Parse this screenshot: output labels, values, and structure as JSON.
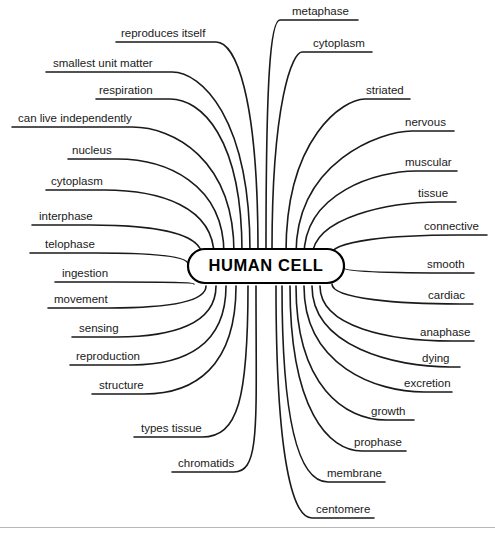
{
  "diagram": {
    "type": "mind-map",
    "title": "HUMAN CELL",
    "center": {
      "label": "HUMAN CELL",
      "x": 266,
      "y": 266,
      "width": 156,
      "height": 34,
      "radius": 17
    },
    "style": {
      "background": "#ffffff",
      "line_color": "#1a1a1a",
      "text_color": "#1a1a1a",
      "node_border": "#000000",
      "divider_color": "#b8b8b8"
    },
    "divider": {
      "y": 527
    },
    "branches": [
      {
        "id": "metaphase",
        "label": "metaphase",
        "side": "right",
        "label_x": 292,
        "label_y": 6,
        "line_x1": 272,
        "line_x2": 358,
        "line_y": 20,
        "anchor_x": 272,
        "anchor_y": 40,
        "curve_dx": 8,
        "hub_x": 266,
        "hub_y": 250
      },
      {
        "id": "cytoplasm-top",
        "label": "cytoplasm",
        "side": "right",
        "label_x": 313,
        "label_y": 38,
        "line_x1": 294,
        "line_x2": 372,
        "line_y": 52,
        "anchor_x": 294,
        "anchor_y": 72,
        "curve_dx": 8,
        "hub_x": 272,
        "hub_y": 250
      },
      {
        "id": "striated",
        "label": "striated",
        "side": "right",
        "label_x": 366,
        "label_y": 85,
        "line_x1": 347,
        "line_x2": 410,
        "line_y": 99,
        "anchor_x": 347,
        "anchor_y": 115,
        "curve_dx": 18,
        "hub_x": 286,
        "hub_y": 252
      },
      {
        "id": "nervous",
        "label": "nervous",
        "side": "right",
        "label_x": 405,
        "label_y": 117,
        "line_x1": 386,
        "line_x2": 454,
        "line_y": 131,
        "anchor_x": 386,
        "anchor_y": 146,
        "curve_dx": 26,
        "hub_x": 296,
        "hub_y": 254
      },
      {
        "id": "muscular",
        "label": "muscular",
        "side": "right",
        "label_x": 405,
        "label_y": 157,
        "line_x1": 384,
        "line_x2": 457,
        "line_y": 171,
        "anchor_x": 384,
        "anchor_y": 184,
        "curve_dx": 32,
        "hub_x": 304,
        "hub_y": 256
      },
      {
        "id": "tissue",
        "label": "tissue",
        "side": "right",
        "label_x": 418,
        "label_y": 188,
        "line_x1": 400,
        "line_x2": 456,
        "line_y": 202,
        "anchor_x": 400,
        "anchor_y": 213,
        "curve_dx": 40,
        "hub_x": 312,
        "hub_y": 258
      },
      {
        "id": "connective",
        "label": "connective",
        "side": "right",
        "label_x": 424,
        "label_y": 221,
        "line_x1": 404,
        "line_x2": 487,
        "line_y": 235,
        "anchor_x": 404,
        "anchor_y": 243,
        "curve_dx": 54,
        "hub_x": 330,
        "hub_y": 256
      },
      {
        "id": "smooth",
        "label": "smooth",
        "side": "right",
        "label_x": 427,
        "label_y": 259,
        "line_x1": 408,
        "line_x2": 474,
        "line_y": 273,
        "anchor_x": 408,
        "anchor_y": 273,
        "curve_dx": 50,
        "hub_x": 344,
        "hub_y": 268
      },
      {
        "id": "cardiac",
        "label": "cardiac",
        "side": "right",
        "label_x": 428,
        "label_y": 290,
        "line_x1": 410,
        "line_x2": 473,
        "line_y": 304,
        "anchor_x": 410,
        "anchor_y": 304,
        "curve_dx": 50,
        "hub_x": 332,
        "hub_y": 284
      },
      {
        "id": "anaphase",
        "label": "anaphase",
        "side": "right",
        "label_x": 420,
        "label_y": 327,
        "line_x1": 400,
        "line_x2": 474,
        "line_y": 341,
        "anchor_x": 400,
        "anchor_y": 341,
        "curve_dx": 52,
        "hub_x": 320,
        "hub_y": 286
      },
      {
        "id": "dying",
        "label": "dying",
        "side": "right",
        "label_x": 422,
        "label_y": 353,
        "line_x1": 404,
        "line_x2": 460,
        "line_y": 367,
        "anchor_x": 404,
        "anchor_y": 367,
        "curve_dx": 46,
        "hub_x": 312,
        "hub_y": 286
      },
      {
        "id": "excretion",
        "label": "excretion",
        "side": "right",
        "label_x": 404,
        "label_y": 378,
        "line_x1": 384,
        "line_x2": 452,
        "line_y": 392,
        "anchor_x": 384,
        "anchor_y": 392,
        "curve_dx": 40,
        "hub_x": 304,
        "hub_y": 286
      },
      {
        "id": "growth",
        "label": "growth",
        "side": "right",
        "label_x": 371,
        "label_y": 406,
        "line_x1": 352,
        "line_x2": 414,
        "line_y": 420,
        "anchor_x": 352,
        "anchor_y": 420,
        "curve_dx": 34,
        "hub_x": 296,
        "hub_y": 286
      },
      {
        "id": "prophase",
        "label": "prophase",
        "side": "right",
        "label_x": 354,
        "label_y": 437,
        "line_x1": 334,
        "line_x2": 406,
        "line_y": 451,
        "anchor_x": 334,
        "anchor_y": 451,
        "curve_dx": 28,
        "hub_x": 290,
        "hub_y": 286
      },
      {
        "id": "membrane",
        "label": "membrane",
        "side": "right",
        "label_x": 327,
        "label_y": 468,
        "line_x1": 306,
        "line_x2": 385,
        "line_y": 482,
        "anchor_x": 306,
        "anchor_y": 482,
        "curve_dx": 22,
        "hub_x": 282,
        "hub_y": 286
      },
      {
        "id": "centomere",
        "label": "centomere",
        "side": "right",
        "label_x": 316,
        "label_y": 504,
        "line_x1": 296,
        "line_x2": 374,
        "line_y": 518,
        "anchor_x": 296,
        "anchor_y": 518,
        "curve_dx": 16,
        "hub_x": 276,
        "hub_y": 286
      },
      {
        "id": "reproduces-itself",
        "label": "reproduces itself",
        "side": "left",
        "label_x": 121,
        "label_y": 28,
        "line_x1": 116,
        "line_x2": 232,
        "line_y": 42,
        "anchor_x": 232,
        "anchor_y": 58,
        "curve_dx": 16,
        "hub_x": 258,
        "hub_y": 250
      },
      {
        "id": "smallest-unit-matter",
        "label": "smallest unit matter",
        "side": "left",
        "label_x": 53,
        "label_y": 58,
        "line_x1": 46,
        "line_x2": 196,
        "line_y": 72,
        "anchor_x": 196,
        "anchor_y": 88,
        "curve_dx": 24,
        "hub_x": 250,
        "hub_y": 251
      },
      {
        "id": "respiration",
        "label": "respiration",
        "side": "left",
        "label_x": 99,
        "label_y": 85,
        "line_x1": 96,
        "line_x2": 196,
        "line_y": 99,
        "anchor_x": 196,
        "anchor_y": 115,
        "curve_dx": 26,
        "hub_x": 242,
        "hub_y": 252
      },
      {
        "id": "can-live-independently",
        "label": "can live independently",
        "side": "left",
        "label_x": 18,
        "label_y": 113,
        "line_x1": 12,
        "line_x2": 166,
        "line_y": 127,
        "anchor_x": 166,
        "anchor_y": 143,
        "curve_dx": 34,
        "hub_x": 234,
        "hub_y": 253
      },
      {
        "id": "nucleus",
        "label": "nucleus",
        "side": "left",
        "label_x": 72,
        "label_y": 145,
        "line_x1": 68,
        "line_x2": 157,
        "line_y": 159,
        "anchor_x": 157,
        "anchor_y": 175,
        "curve_dx": 40,
        "hub_x": 224,
        "hub_y": 254
      },
      {
        "id": "cytoplasm-left",
        "label": "cytoplasm",
        "side": "left",
        "label_x": 51,
        "label_y": 176,
        "line_x1": 46,
        "line_x2": 150,
        "line_y": 190,
        "anchor_x": 150,
        "anchor_y": 204,
        "curve_dx": 46,
        "hub_x": 214,
        "hub_y": 256
      },
      {
        "id": "interphase",
        "label": "interphase",
        "side": "left",
        "label_x": 39,
        "label_y": 211,
        "line_x1": 32,
        "line_x2": 142,
        "line_y": 225,
        "anchor_x": 142,
        "anchor_y": 237,
        "curve_dx": 52,
        "hub_x": 202,
        "hub_y": 256
      },
      {
        "id": "telophase",
        "label": "telophase",
        "side": "left",
        "label_x": 45,
        "label_y": 239,
        "line_x1": 30,
        "line_x2": 142,
        "line_y": 253,
        "anchor_x": 142,
        "anchor_y": 262,
        "curve_dx": 46,
        "hub_x": 188,
        "hub_y": 264
      },
      {
        "id": "ingestion",
        "label": "ingestion",
        "side": "left",
        "label_x": 62,
        "label_y": 268,
        "line_x1": 55,
        "line_x2": 160,
        "line_y": 282,
        "anchor_x": 160,
        "anchor_y": 282,
        "curve_dx": 46,
        "hub_x": 194,
        "hub_y": 284
      },
      {
        "id": "movement",
        "label": "movement",
        "side": "left",
        "label_x": 54,
        "label_y": 294,
        "line_x1": 48,
        "line_x2": 157,
        "line_y": 308,
        "anchor_x": 157,
        "anchor_y": 308,
        "curve_dx": 48,
        "hub_x": 206,
        "hub_y": 286
      },
      {
        "id": "sensing",
        "label": "sensing",
        "side": "left",
        "label_x": 79,
        "label_y": 323,
        "line_x1": 72,
        "line_x2": 163,
        "line_y": 337,
        "anchor_x": 163,
        "anchor_y": 337,
        "curve_dx": 46,
        "hub_x": 216,
        "hub_y": 286
      },
      {
        "id": "reproduction",
        "label": "reproduction",
        "side": "left",
        "label_x": 76,
        "label_y": 351,
        "line_x1": 70,
        "line_x2": 176,
        "line_y": 365,
        "anchor_x": 176,
        "anchor_y": 365,
        "curve_dx": 44,
        "hub_x": 226,
        "hub_y": 286
      },
      {
        "id": "structure",
        "label": "structure",
        "side": "left",
        "label_x": 99,
        "label_y": 380,
        "line_x1": 92,
        "line_x2": 186,
        "line_y": 394,
        "anchor_x": 186,
        "anchor_y": 394,
        "curve_dx": 42,
        "hub_x": 236,
        "hub_y": 286
      },
      {
        "id": "types-tissue",
        "label": "types tissue",
        "side": "left",
        "label_x": 141,
        "label_y": 423,
        "line_x1": 134,
        "line_x2": 232,
        "line_y": 437,
        "anchor_x": 232,
        "anchor_y": 437,
        "curve_dx": 30,
        "hub_x": 248,
        "hub_y": 286
      },
      {
        "id": "chromatids",
        "label": "chromatids",
        "side": "left",
        "label_x": 178,
        "label_y": 458,
        "line_x1": 172,
        "line_x2": 256,
        "line_y": 472,
        "anchor_x": 256,
        "anchor_y": 472,
        "curve_dx": 22,
        "hub_x": 256,
        "hub_y": 286
      }
    ]
  }
}
